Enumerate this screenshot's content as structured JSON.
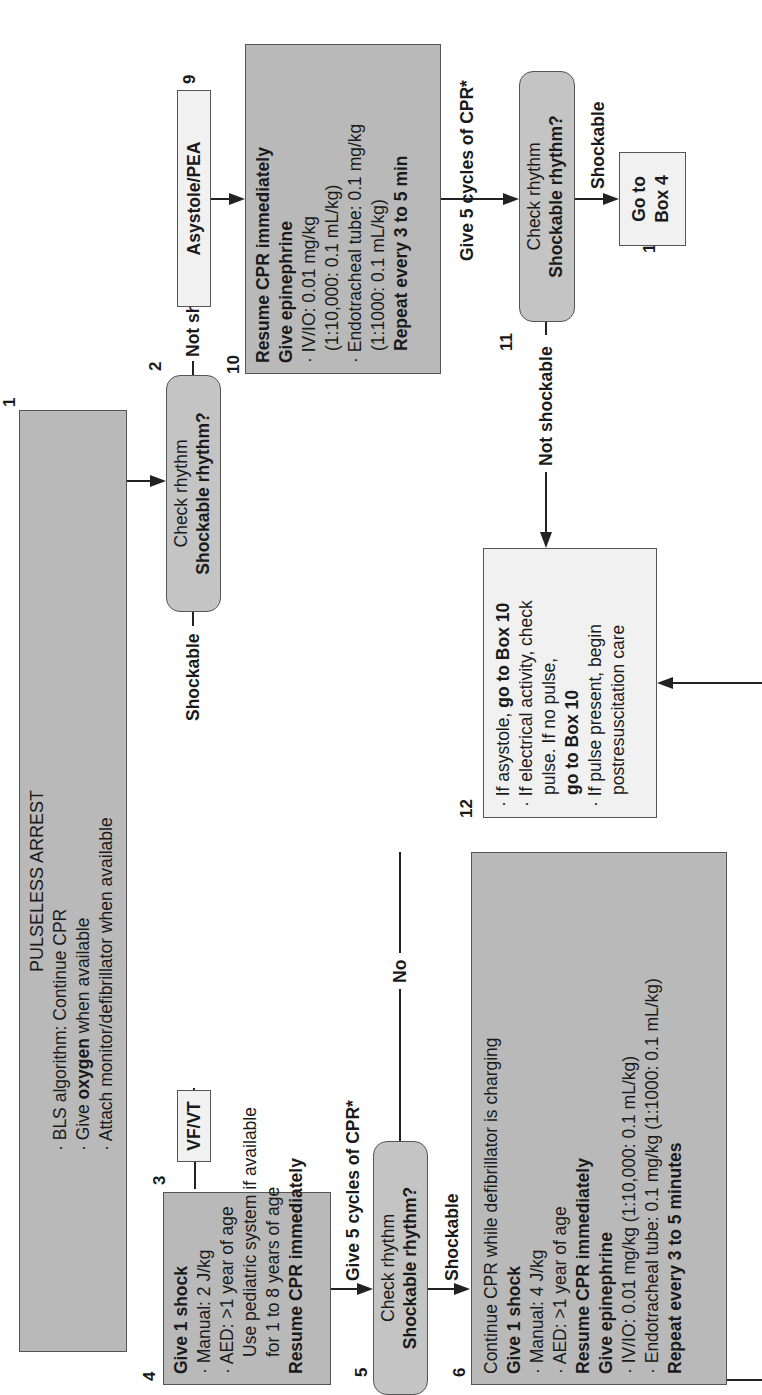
{
  "orientation": "rotated 90 degrees counter-clockwise",
  "colors": {
    "action_box": "#b9b9b9",
    "info_box": "#f1f1f1",
    "decision_box": "#c4c4c4",
    "line": "#222222"
  },
  "box1": {
    "number": "1",
    "title": "PULSELESS ARREST",
    "line1": "BLS algorithm: Continue CPR",
    "line2_pre": "Give ",
    "line2_bold": "oxygen",
    "line2_post": " when available",
    "line3": "Attach monitor/defibrillator when available"
  },
  "box2": {
    "number": "2",
    "line1": "Check rhythm",
    "line2": "Shockable rhythm?"
  },
  "box3": {
    "number": "3",
    "label": "VF/VT"
  },
  "box4": {
    "number": "4",
    "title": "Give 1 shock",
    "bullet1": "Manual: 2 J/kg",
    "bullet2": "AED: >1 year of age",
    "bullet2_cont1": "Use pediatric system if available",
    "bullet2_cont2": "for 1 to 8 years of age",
    "footer": "Resume CPR immediately"
  },
  "box5": {
    "number": "5",
    "line1": "Check rhythm",
    "line2": "Shockable rhythm?"
  },
  "box6": {
    "number": "6",
    "line1": "Continue CPR while defibrillator is charging",
    "line2": "Give 1 shock",
    "bullet1": "Manual: 4 J/kg",
    "bullet2": "AED: >1 year of age",
    "line3": "Resume CPR immediately",
    "line4": "Give epinephrine",
    "bullet3": "IV/IO: 0.01 mg/kg (1:10,000: 0.1 mL/kg)",
    "bullet4": "Endotracheal tube: 0.1 mg/kg (1:1000: 0.1 mL/kg)",
    "line5": "Repeat every 3 to 5 minutes"
  },
  "box9": {
    "number": "9",
    "label": "Asystole/PEA"
  },
  "box10": {
    "number": "10",
    "line1": "Resume CPR immediately",
    "line2": "Give epinephrine",
    "bullet1": "IV/IO: 0.01 mg/kg",
    "bullet1_cont": "(1:10,000: 0.1 mL/kg)",
    "bullet2": "Endotracheal tube: 0.1 mg/kg",
    "bullet2_cont": "(1:1000: 0.1 mL/kg)",
    "line3": "Repeat every 3 to 5 min"
  },
  "box11": {
    "number": "11",
    "line1": "Check rhythm",
    "line2": "Shockable rhythm?"
  },
  "box12": {
    "number": "12",
    "b1_pre": "If asystole, ",
    "b1_bold": "go to Box 10",
    "b2": "If electrical activity, check",
    "b2_cont": "pulse. If no pulse,",
    "b2_bold": "go to Box 10",
    "b3": "If pulse present, begin",
    "b3_cont": "postresuscitation care"
  },
  "box13": {
    "number": "13",
    "line1": "Go to",
    "line2": "Box 4"
  },
  "edges": {
    "shockable_2_3": "Shockable",
    "not_shockable_2_9": "Not shockable",
    "cpr_4_5": "Give 5 cycles of CPR*",
    "cpr_10_11": "Give 5 cycles of CPR*",
    "no_5_12": "No",
    "shockable_5_6": "Shockable",
    "not_shockable_11_12": "Not shockable",
    "shockable_11_13": "Shockable"
  },
  "bullet": "·"
}
